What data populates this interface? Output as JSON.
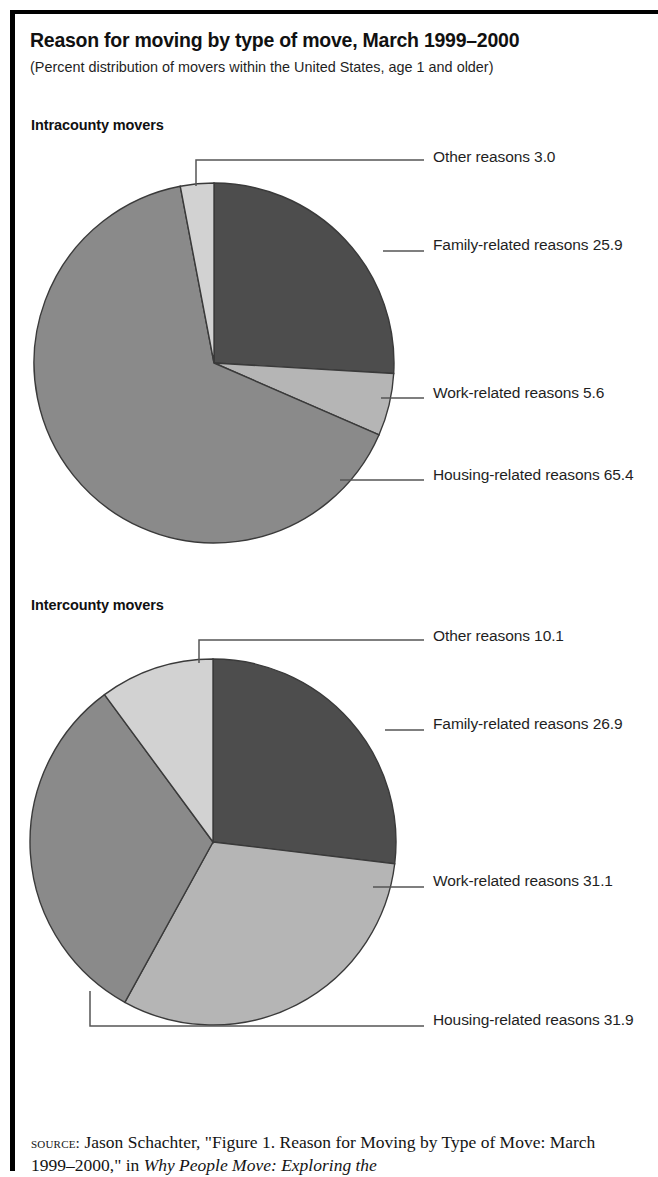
{
  "figure": {
    "title": "Reason for moving by type of move, March 1999–2000",
    "subtitle": "(Percent distribution of movers within the United States, age 1 and older)"
  },
  "panels": [
    {
      "heading": "Intracounty movers"
    },
    {
      "heading": "Intercounty movers"
    }
  ],
  "labels": {
    "p1_other": "Other reasons 3.0",
    "p1_family": "Family-related reasons 25.9",
    "p1_work": "Work-related reasons 5.6",
    "p1_housing": "Housing-related reasons 65.4",
    "p2_other": "Other reasons 10.1",
    "p2_family": "Family-related reasons 26.9",
    "p2_work": "Work-related reasons 31.1",
    "p2_housing": "Housing-related reasons 31.9"
  },
  "source": {
    "kicker": "source:",
    "text_before_italic": " Jason Schachter, \"Figure 1. Reason for Moving by Type of Move: March 1999–2000,\" in ",
    "italic_text": "Why People Move: Exploring the"
  },
  "colors": {
    "family_slice": "#4d4d4d",
    "work_slice": "#b5b5b5",
    "housing_slice": "#8a8a8a",
    "other_slice": "#d2d2d2",
    "slice_outline": "#3a3a3a",
    "leader_line": "#555555",
    "frame": "#000000",
    "text": "#1a1a1a"
  },
  "chart_data": [
    {
      "type": "pie",
      "title": "Intracounty movers",
      "categories": [
        "Family-related reasons",
        "Work-related reasons",
        "Housing-related reasons",
        "Other reasons"
      ],
      "values": [
        25.9,
        5.6,
        65.4,
        3.0
      ],
      "units": "percent",
      "start_angle_deg": 0,
      "direction": "clockwise",
      "slice_colors": [
        "#4d4d4d",
        "#b5b5b5",
        "#8a8a8a",
        "#d2d2d2"
      ],
      "legend": "callout labels at right",
      "xlabel": "",
      "ylabel": ""
    },
    {
      "type": "pie",
      "title": "Intercounty movers",
      "categories": [
        "Family-related reasons",
        "Work-related reasons",
        "Housing-related reasons",
        "Other reasons"
      ],
      "values": [
        26.9,
        31.1,
        31.9,
        10.1
      ],
      "units": "percent",
      "start_angle_deg": 0,
      "direction": "clockwise",
      "slice_colors": [
        "#4d4d4d",
        "#b5b5b5",
        "#8a8a8a",
        "#d2d2d2"
      ],
      "legend": "callout labels at right",
      "xlabel": "",
      "ylabel": ""
    }
  ]
}
